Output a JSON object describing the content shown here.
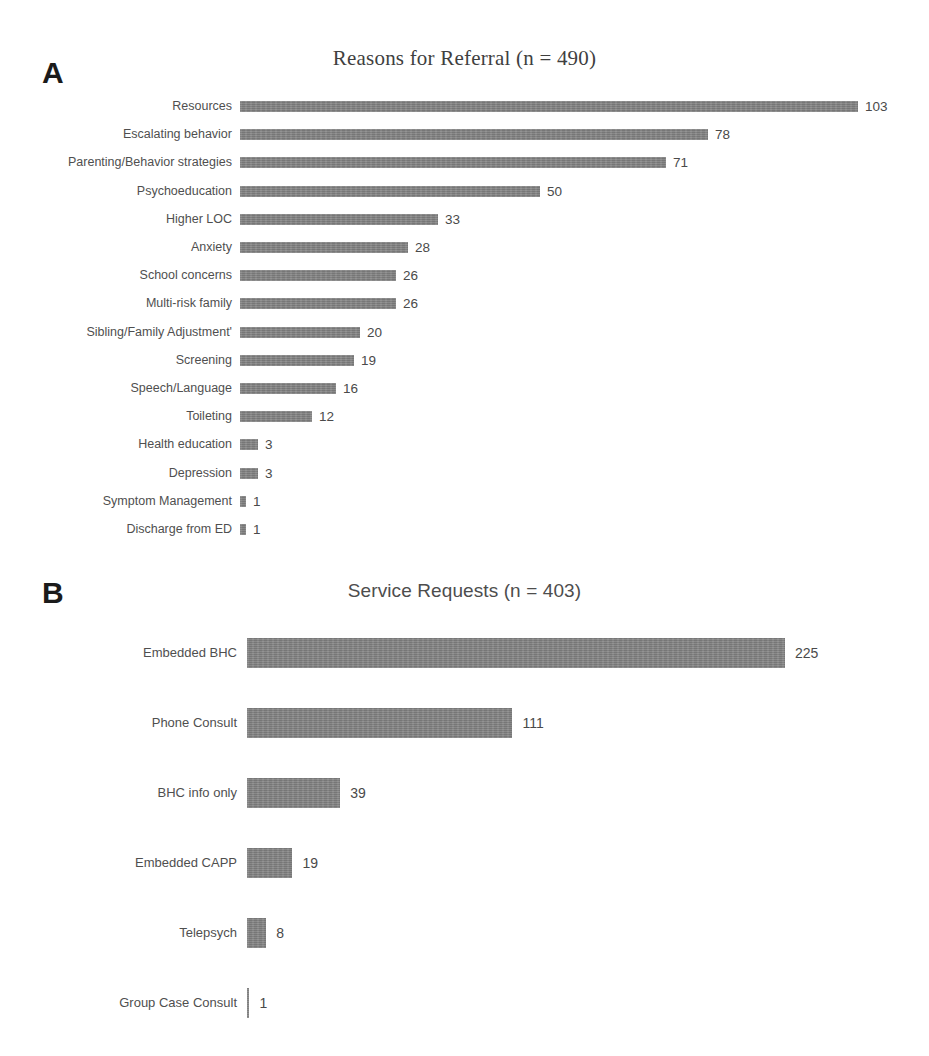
{
  "figure": {
    "panel_a_letter": "A",
    "panel_b_letter": "B"
  },
  "chart_data": [
    {
      "type": "bar",
      "orientation": "horizontal",
      "panel": "A",
      "title": "Reasons for Referral (n = 490)",
      "xlabel": "",
      "ylabel": "",
      "grid": false,
      "legend": "none",
      "data_labels": true,
      "total_n": 490,
      "xlim": [
        0,
        103
      ],
      "categories": [
        "Resources",
        "Escalating behavior",
        "Parenting/Behavior strategies",
        "Psychoeducation",
        "Higher LOC",
        "Anxiety",
        "School concerns",
        "Multi-risk family",
        "Sibling/Family Adjustment'",
        "Screening",
        "Speech/Language",
        "Toileting",
        "Health education",
        "Depression",
        "Symptom Management",
        "Discharge from ED"
      ],
      "values": [
        103,
        78,
        71,
        50,
        33,
        28,
        26,
        26,
        20,
        19,
        16,
        12,
        3,
        3,
        1,
        1
      ]
    },
    {
      "type": "bar",
      "orientation": "horizontal",
      "panel": "B",
      "title": "Service Requests (n = 403)",
      "xlabel": "",
      "ylabel": "",
      "grid": false,
      "legend": "none",
      "data_labels": true,
      "total_n": 403,
      "xlim": [
        0,
        225
      ],
      "categories": [
        "Embedded BHC",
        "Phone Consult",
        "BHC info only",
        "Embedded CAPP",
        "Telepsych",
        "Group Case Consult"
      ],
      "values": [
        225,
        111,
        39,
        19,
        8,
        1
      ]
    }
  ],
  "style": {
    "bar_color": "#808080",
    "label_color": "#4f4f4f",
    "title_color": "#44444a",
    "background": "#ffffff"
  }
}
